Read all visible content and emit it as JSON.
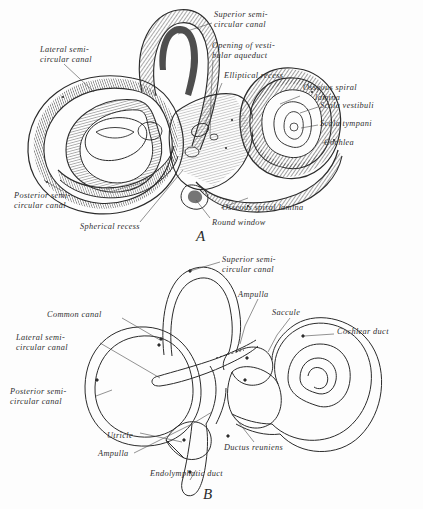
{
  "plate": {
    "title": "Bony and membranous labyrinth of the inner ear",
    "background_color": "#fdfdfd",
    "ink_color": "#2b2b2b"
  },
  "figures": [
    {
      "key": "A",
      "caption": "A",
      "style": "engraving",
      "description": "Osseous (bony) labyrinth, lateral view",
      "labels": [
        {
          "id": "a-superior-semicircular-canal",
          "text": "Superior semi-\ncircular canal",
          "x": 214,
          "y": 14,
          "align": "left"
        },
        {
          "id": "a-opening-of-vestibular-aqueduct",
          "text": "Opening of vesti-\nbular aqueduct",
          "x": 212,
          "y": 44,
          "align": "left"
        },
        {
          "id": "a-elliptical-recess",
          "text": "Elliptical recess",
          "x": 224,
          "y": 74,
          "align": "left"
        },
        {
          "id": "a-osseous-spiral-lamina-top",
          "text": "Osseous spiral\n     lamina",
          "x": 303,
          "y": 86,
          "align": "left"
        },
        {
          "id": "a-scala-vestibuli",
          "text": "Scala vestibuli",
          "x": 320,
          "y": 104,
          "align": "left"
        },
        {
          "id": "a-scala-tympani",
          "text": "Scala tympani",
          "x": 320,
          "y": 122,
          "align": "left"
        },
        {
          "id": "a-cochlea",
          "text": "Cochlea",
          "x": 324,
          "y": 141,
          "align": "left"
        },
        {
          "id": "a-lateral-semicircular-canal",
          "text": "Lateral semi-\ncircular canal",
          "x": 40,
          "y": 48,
          "align": "left"
        },
        {
          "id": "a-posterior-semicircular-canal",
          "text": "Posterior semi-\ncircular canal",
          "x": 14,
          "y": 194,
          "align": "left"
        },
        {
          "id": "a-spherical-recess",
          "text": "Spherical recess",
          "x": 80,
          "y": 225,
          "align": "left"
        },
        {
          "id": "a-osseous-spiral-lamina-bottom",
          "text": "Osseous spiral lamina",
          "x": 222,
          "y": 206,
          "align": "left"
        },
        {
          "id": "a-round-window",
          "text": "Round window",
          "x": 212,
          "y": 221,
          "align": "left"
        }
      ]
    },
    {
      "key": "B",
      "caption": "B",
      "style": "line-drawing",
      "description": "Membranous labyrinth, lateral view",
      "labels": [
        {
          "id": "b-superior-semicircular-canal",
          "text": "Superior semi-\ncircular canal",
          "x": 222,
          "y": 258,
          "align": "left"
        },
        {
          "id": "b-ampulla-upper",
          "text": "Ampulla",
          "x": 238,
          "y": 293,
          "align": "left"
        },
        {
          "id": "b-saccule",
          "text": "Saccule",
          "x": 272,
          "y": 311,
          "align": "left"
        },
        {
          "id": "b-cochlear-duct",
          "text": "Cochlear duct",
          "x": 337,
          "y": 330,
          "align": "left"
        },
        {
          "id": "b-common-canal",
          "text": "Common canal",
          "x": 47,
          "y": 313,
          "align": "left"
        },
        {
          "id": "b-lateral-semicircular-canal",
          "text": "Lateral semi-\ncircular canal",
          "x": 16,
          "y": 336,
          "align": "left"
        },
        {
          "id": "b-posterior-semicircular-canal",
          "text": "Posterior semi-\ncircular canal",
          "x": 10,
          "y": 390,
          "align": "left"
        },
        {
          "id": "b-utricle",
          "text": "Utricle",
          "x": 107,
          "y": 434,
          "align": "left"
        },
        {
          "id": "b-ampulla-lower",
          "text": "Ampulla",
          "x": 98,
          "y": 452,
          "align": "left"
        },
        {
          "id": "b-ductus-reuniens",
          "text": "Ductus reuniens",
          "x": 224,
          "y": 446,
          "align": "left"
        },
        {
          "id": "b-endolymphatic-duct",
          "text": "Endolymphatic duct",
          "x": 150,
          "y": 472,
          "align": "left"
        }
      ]
    }
  ],
  "figure_captions": {
    "a": {
      "text": "A",
      "x": 196,
      "y": 231
    },
    "b": {
      "text": "B",
      "x": 203,
      "y": 489
    }
  }
}
